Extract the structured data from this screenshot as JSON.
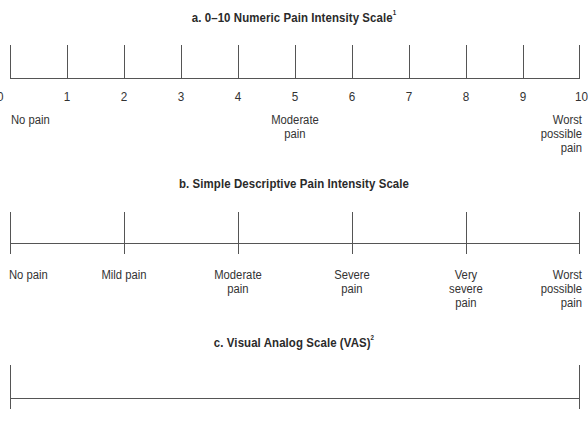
{
  "scales": {
    "a": {
      "title": "a. 0–10 Numeric Pain Intensity Scale",
      "title_sup": "1",
      "numbers": [
        "0",
        "1",
        "2",
        "3",
        "4",
        "5",
        "6",
        "7",
        "8",
        "9",
        "10"
      ],
      "anchors": {
        "no_pain": "No pain",
        "moderate_line1": "Moderate",
        "moderate_line2": "pain",
        "worst_line1": "Worst",
        "worst_line2": "possible",
        "worst_line3": "pain"
      }
    },
    "b": {
      "title": "b. Simple Descriptive Pain Intensity Scale",
      "labels": [
        {
          "line1": "No pain",
          "line2": "",
          "line3": ""
        },
        {
          "line1": "Mild pain",
          "line2": "",
          "line3": ""
        },
        {
          "line1": "Moderate",
          "line2": "pain",
          "line3": ""
        },
        {
          "line1": "Severe",
          "line2": "pain",
          "line3": ""
        },
        {
          "line1": "Very",
          "line2": "severe",
          "line3": "pain"
        },
        {
          "line1": "Worst",
          "line2": "possible",
          "line3": "pain"
        }
      ]
    },
    "c": {
      "title": "c. Visual Analog Scale (VAS)",
      "title_sup": "2"
    }
  },
  "colors": {
    "line": "#555555",
    "text": "#333333",
    "background": "#ffffff"
  }
}
